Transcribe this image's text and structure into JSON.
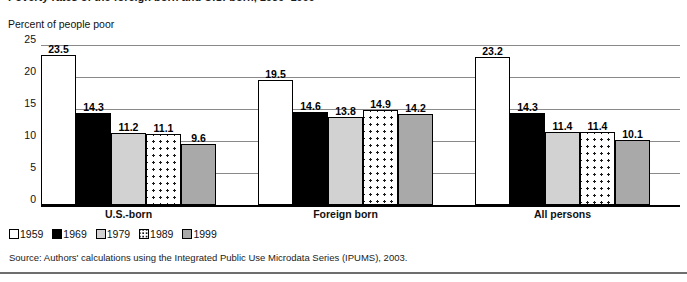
{
  "figure": {
    "title_cropped": "Poverty rates of the foreign born and U.S.-born, 1959–1999",
    "axis_caption": "Percent of people poor",
    "source_note": "Source: Authors' calculations using the Integrated Public Use Microdata Series (IPUMS), 2003."
  },
  "chart_data": {
    "type": "bar",
    "title": "",
    "xlabel": "",
    "ylabel": "Percent of people poor",
    "ylim": [
      0,
      25
    ],
    "yticks": [
      0,
      5,
      10,
      15,
      20,
      25
    ],
    "ytick_labels": [
      "0",
      "5",
      "10",
      "15",
      "20",
      "25"
    ],
    "grid": true,
    "legend_position": "below-left",
    "categories": [
      "U.S.-born",
      "Foreign born",
      "All persons"
    ],
    "series": [
      {
        "name": "1959",
        "fill": "white",
        "color": "#ffffff",
        "values": [
          23.5,
          19.5,
          23.2
        ]
      },
      {
        "name": "1969",
        "fill": "black",
        "color": "#000000",
        "values": [
          14.3,
          14.6,
          14.3
        ]
      },
      {
        "name": "1979",
        "fill": "lightgray",
        "color": "#d2d2d2",
        "values": [
          11.2,
          13.8,
          11.4
        ]
      },
      {
        "name": "1989",
        "fill": "dotted",
        "color": "#ffffff",
        "values": [
          11.1,
          14.9,
          11.4
        ]
      },
      {
        "name": "1999",
        "fill": "midgray",
        "color": "#a9a9a9",
        "values": [
          9.6,
          14.2,
          10.1
        ]
      }
    ],
    "data_labels": [
      [
        "23.5",
        "14.3",
        "11.2",
        "11.1",
        "9.6"
      ],
      [
        "19.5",
        "14.6",
        "13.8",
        "14.9",
        "14.2"
      ],
      [
        "23.2",
        "14.3",
        "11.4",
        "11.4",
        "10.1"
      ]
    ]
  },
  "legend": {
    "items": [
      {
        "label": "1959",
        "swatch": "white-swatch"
      },
      {
        "label": "1969",
        "swatch": "black-swatch"
      },
      {
        "label": "1979",
        "swatch": "lightgray-swatch"
      },
      {
        "label": "1989",
        "swatch": "dotted-swatch"
      },
      {
        "label": "1999",
        "swatch": "midgray-swatch"
      }
    ]
  }
}
